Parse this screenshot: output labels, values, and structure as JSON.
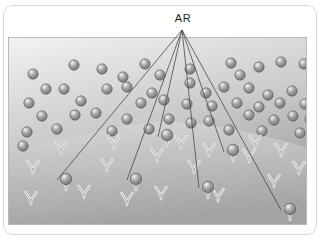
{
  "figure": {
    "title": "AR",
    "label": {
      "text": "AR",
      "name": "antigen-receptor-label",
      "x": 182,
      "y": 22
    },
    "colors": {
      "background": "#ffffff",
      "frame_border": "#d8d8d8",
      "panel_border": "#b9b9b9",
      "upper_region_light": "#f2f2f2",
      "upper_region_dark": "#9d9d9d",
      "lower_region_light": "#d9d9d9",
      "lower_region_dark": "#a3a3a3",
      "sphere_highlight": "#f4f4f4",
      "sphere_mid": "#a8a8a8",
      "sphere_edge": "#6d6d6d",
      "sphere_outline": "#5a5a5a",
      "receptor_fill": "#f0f0f0",
      "receptor_stroke": "#8f8f8f",
      "leader_line": "#4a4a4a",
      "label_text": "#1b1b1b"
    },
    "panel": {
      "x": 8,
      "y": 37,
      "width": 299,
      "height": 188
    },
    "membrane": {
      "name": "membrane-boundary",
      "description": "curved boundary arching upward at centre separating upper region from lower region",
      "path": "M0,112 C60,100 110,86 150,84 C200,82 250,96 299,110 L299,188 L0,188 Z"
    },
    "leader_origin": {
      "x": 182,
      "y": 30
    },
    "leader_lines": [
      {
        "name": "leader-line-1",
        "x1": 182,
        "y1": 30,
        "x2": 57,
        "y2": 180
      },
      {
        "name": "leader-line-2",
        "x1": 182,
        "y1": 30,
        "x2": 127,
        "y2": 180
      },
      {
        "name": "leader-line-3",
        "x1": 182,
        "y1": 30,
        "x2": 158,
        "y2": 137
      },
      {
        "name": "leader-line-4",
        "x1": 182,
        "y1": 30,
        "x2": 199,
        "y2": 188
      },
      {
        "name": "leader-line-5",
        "x1": 182,
        "y1": 30,
        "x2": 224,
        "y2": 152
      },
      {
        "name": "leader-line-6",
        "x1": 182,
        "y1": 30,
        "x2": 281,
        "y2": 210
      }
    ],
    "free_spheres": [
      {
        "x": 24,
        "y": 71
      },
      {
        "x": 65,
        "y": 62
      },
      {
        "x": 93,
        "y": 66
      },
      {
        "x": 114,
        "y": 74
      },
      {
        "x": 136,
        "y": 61
      },
      {
        "x": 151,
        "y": 72
      },
      {
        "x": 181,
        "y": 66
      },
      {
        "x": 181,
        "y": 80
      },
      {
        "x": 222,
        "y": 60
      },
      {
        "x": 231,
        "y": 72
      },
      {
        "x": 250,
        "y": 64
      },
      {
        "x": 272,
        "y": 59
      },
      {
        "x": 295,
        "y": 61
      },
      {
        "x": 37,
        "y": 86
      },
      {
        "x": 55,
        "y": 86
      },
      {
        "x": 98,
        "y": 86
      },
      {
        "x": 118,
        "y": 84
      },
      {
        "x": 143,
        "y": 90
      },
      {
        "x": 155,
        "y": 97
      },
      {
        "x": 197,
        "y": 90
      },
      {
        "x": 215,
        "y": 84
      },
      {
        "x": 240,
        "y": 85
      },
      {
        "x": 259,
        "y": 92
      },
      {
        "x": 283,
        "y": 88
      },
      {
        "x": 20,
        "y": 100
      },
      {
        "x": 72,
        "y": 98
      },
      {
        "x": 132,
        "y": 100
      },
      {
        "x": 178,
        "y": 101
      },
      {
        "x": 203,
        "y": 103
      },
      {
        "x": 228,
        "y": 100
      },
      {
        "x": 250,
        "y": 104
      },
      {
        "x": 271,
        "y": 100
      },
      {
        "x": 296,
        "y": 101
      },
      {
        "x": 33,
        "y": 113
      },
      {
        "x": 66,
        "y": 112
      },
      {
        "x": 87,
        "y": 110
      },
      {
        "x": 118,
        "y": 116
      },
      {
        "x": 160,
        "y": 116
      },
      {
        "x": 182,
        "y": 120
      },
      {
        "x": 200,
        "y": 118
      },
      {
        "x": 240,
        "y": 112
      },
      {
        "x": 265,
        "y": 117
      },
      {
        "x": 284,
        "y": 113
      },
      {
        "x": 301,
        "y": 116
      },
      {
        "x": 18,
        "y": 129
      },
      {
        "x": 48,
        "y": 126
      },
      {
        "x": 103,
        "y": 128
      },
      {
        "x": 140,
        "y": 126
      },
      {
        "x": 220,
        "y": 127
      },
      {
        "x": 253,
        "y": 128
      },
      {
        "x": 291,
        "y": 130
      },
      {
        "x": 14,
        "y": 143
      }
    ],
    "free_receptors": [
      {
        "x": 24,
        "y": 172
      },
      {
        "x": 52,
        "y": 153
      },
      {
        "x": 105,
        "y": 147
      },
      {
        "x": 98,
        "y": 170
      },
      {
        "x": 148,
        "y": 160
      },
      {
        "x": 172,
        "y": 147
      },
      {
        "x": 185,
        "y": 172
      },
      {
        "x": 200,
        "y": 155
      },
      {
        "x": 240,
        "y": 161
      },
      {
        "x": 246,
        "y": 147
      },
      {
        "x": 272,
        "y": 155
      },
      {
        "x": 290,
        "y": 173
      },
      {
        "x": 22,
        "y": 203
      },
      {
        "x": 75,
        "y": 197
      },
      {
        "x": 118,
        "y": 204
      },
      {
        "x": 152,
        "y": 198
      },
      {
        "x": 209,
        "y": 200
      },
      {
        "x": 265,
        "y": 186
      }
    ],
    "bound_complexes": [
      {
        "name": "bound-complex-1",
        "x": 57,
        "y": 178
      },
      {
        "name": "bound-complex-2",
        "x": 127,
        "y": 178
      },
      {
        "name": "bound-complex-3",
        "x": 158,
        "y": 134
      },
      {
        "name": "bound-complex-4",
        "x": 199,
        "y": 186
      },
      {
        "name": "bound-complex-5",
        "x": 224,
        "y": 149
      },
      {
        "name": "bound-complex-6",
        "x": 281,
        "y": 208
      }
    ],
    "geometry": {
      "sphere_radius": 5.2,
      "receptor_width": 11,
      "receptor_height": 12
    }
  }
}
